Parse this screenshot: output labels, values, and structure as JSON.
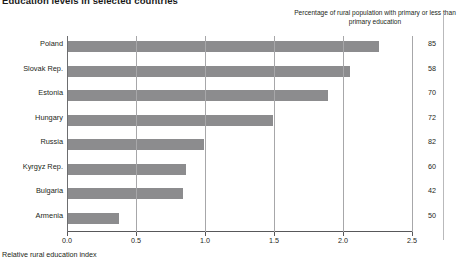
{
  "figure": {
    "title": "Education levels in selected countries",
    "column_caption": "Percentage of rural population with primary or less than primary education",
    "xaxis_title": "Relative rural education index"
  },
  "chart_data": {
    "type": "bar",
    "orientation": "horizontal",
    "title": "Education levels in selected countries",
    "xlabel": "Relative rural education index",
    "ylabel": "",
    "xlim": [
      0.0,
      2.5
    ],
    "xticks": [
      "0.0",
      "0.5",
      "1.0",
      "1.5",
      "2.0",
      "2.5"
    ],
    "xtick_values": [
      0.0,
      0.5,
      1.0,
      1.5,
      2.0,
      2.5
    ],
    "grid": true,
    "grid_axis": "x",
    "legend": "none",
    "bar_color": "#8c8c8e",
    "categories": [
      "Poland",
      "Slovak Rep.",
      "Estonia",
      "Hungary",
      "Russia",
      "Kyrgyz Rep.",
      "Bulgaria",
      "Armenia"
    ],
    "values": [
      2.26,
      2.05,
      1.89,
      1.49,
      0.99,
      0.86,
      0.84,
      0.38
    ],
    "annotation_column": {
      "header": "Percentage of rural population with primary or less than primary education",
      "values": [
        85,
        58,
        70,
        72,
        82,
        60,
        42,
        50
      ]
    },
    "rows": [
      {
        "category": "Poland",
        "value": 2.26,
        "percentage": 85
      },
      {
        "category": "Slovak Rep.",
        "value": 2.05,
        "percentage": 58
      },
      {
        "category": "Estonia",
        "value": 1.89,
        "percentage": 70
      },
      {
        "category": "Hungary",
        "value": 1.49,
        "percentage": 72
      },
      {
        "category": "Russia",
        "value": 0.99,
        "percentage": 82
      },
      {
        "category": "Kyrgyz Rep.",
        "value": 0.86,
        "percentage": 60
      },
      {
        "category": "Bulgaria",
        "value": 0.84,
        "percentage": 42
      },
      {
        "category": "Armenia",
        "value": 0.38,
        "percentage": 50
      }
    ]
  }
}
